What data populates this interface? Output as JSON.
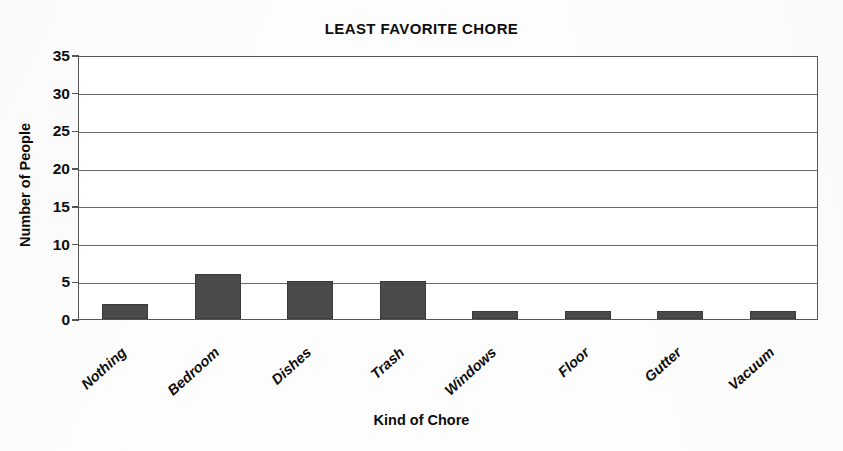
{
  "chart_data": {
    "type": "bar",
    "title": "LEAST FAVORITE CHORE",
    "xlabel": "Kind of Chore",
    "ylabel": "Number of People",
    "categories": [
      "Nothing",
      "Bedroom",
      "Dishes",
      "Trash",
      "Windows",
      "Floor",
      "Gutter",
      "Vacuum"
    ],
    "values": [
      2,
      6,
      5,
      5,
      1,
      1,
      1,
      1
    ],
    "ylim": [
      0,
      35
    ],
    "ytick_labels": [
      "0",
      "5",
      "10",
      "15",
      "20",
      "25",
      "30",
      "35"
    ],
    "ytick_values": [
      0,
      5,
      10,
      15,
      20,
      25,
      30,
      35
    ],
    "grid": true,
    "legend": "none",
    "bar_color": "#4a4a4a",
    "background_color": "#ffffff",
    "axis_color": "#555555"
  }
}
